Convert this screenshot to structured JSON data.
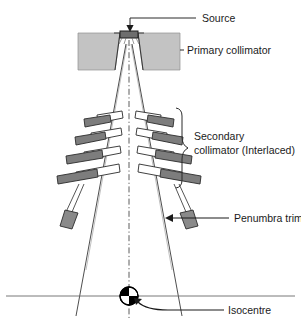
{
  "figure": {
    "background_color": "#ffffff",
    "line_color": "#2b2b2b",
    "colors": {
      "primary_collimator_fill": "#c3c3c3",
      "leaf_bar_fill": "#7d7d7d",
      "leaf_outline_fill": "#ffffff",
      "source_block_fill": "#6e6e6e",
      "trimmer_fill": "#8a8a8a",
      "isocentre_black": "#000000",
      "isocentre_white": "#ffffff",
      "axis_line": "#555555"
    }
  },
  "labels": {
    "source": "Source",
    "primary_collimator": "Primary collimator",
    "secondary_collimator_line1": "Secondary",
    "secondary_collimator_line2": "collimator (Interlaced)",
    "penumbra_trimmers": "Penumbra trimmers",
    "isocentre": "Isocentre"
  },
  "components": {
    "source": {
      "name": "Source",
      "x": 120,
      "y": 36,
      "width": 18,
      "height": 6
    },
    "primary_collimator": {
      "name": "Primary collimator",
      "left_block": {
        "x": 78,
        "y": 33,
        "width": 34,
        "height": 37
      },
      "right_block": {
        "x": 146,
        "y": 33,
        "width": 34,
        "height": 37
      },
      "note": "Two trapezoidal blocks flanking the source aperture"
    },
    "secondary_collimator": {
      "name": "Secondary collimator (Interlaced)",
      "tier_count": 4,
      "leaves_per_tier": 2,
      "top_y": 108,
      "bottom_y": 190,
      "brace_span": [
        108,
        190
      ]
    },
    "penumbra_trimmers": {
      "name": "Penumbra trimmers",
      "count": 2,
      "rod_top_y": 188,
      "block_y": 212,
      "left_block": {
        "x": 64,
        "y": 210,
        "width": 13,
        "height": 17
      },
      "right_block": {
        "x": 148,
        "y": 210,
        "width": 13,
        "height": 17
      }
    },
    "isocentre": {
      "name": "Isocentre",
      "center_x": 129,
      "center_y": 296,
      "radius": 9,
      "quadrant_pattern": "alternating black / white"
    },
    "central_axis": {
      "name": "Central beam axis",
      "style": "dash-dot",
      "x": 129,
      "from_y": 40,
      "to_y": 316
    },
    "patient_plane": {
      "name": "Isocentre plane",
      "y": 296,
      "from_x": 6,
      "to_x": 295
    }
  },
  "leader_lines": [
    {
      "target": "source",
      "from": [
        196,
        18
      ],
      "to": [
        130,
        18
      ],
      "arrow_to": [
        130,
        31
      ],
      "arrow": true
    },
    {
      "target": "primary_collimator",
      "from": [
        182,
        50
      ],
      "to": [
        182,
        50
      ],
      "arrow": false
    },
    {
      "target": "secondary_collimator",
      "brace": true,
      "from": [
        181,
        108
      ],
      "to": [
        181,
        190
      ]
    },
    {
      "target": "penumbra_trimmers",
      "from": [
        228,
        218
      ],
      "to": [
        168,
        218
      ],
      "arrow": true
    },
    {
      "target": "isocentre",
      "from": [
        221,
        309
      ],
      "to": [
        141,
        303
      ],
      "arrow": true,
      "curved": true
    }
  ],
  "label_positions": {
    "source": {
      "x": 202,
      "y": 22
    },
    "primary_collimator": {
      "x": 186,
      "y": 53
    },
    "secondary_collimator": {
      "x": 194,
      "y": 140
    },
    "penumbra_trimmers": {
      "x": 234,
      "y": 222
    },
    "isocentre": {
      "x": 228,
      "y": 313
    }
  }
}
